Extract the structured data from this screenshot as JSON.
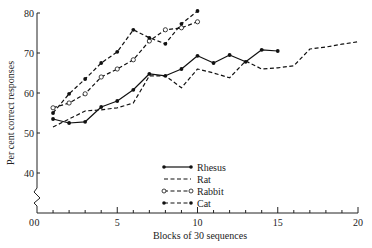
{
  "chart_data": {
    "type": "line",
    "title": "",
    "xlabel": "Blocks of 30 sequences",
    "ylabel": "Per cent correct responses",
    "xlim": [
      0,
      20
    ],
    "ylim": [
      0,
      80
    ],
    "y_axis_break": true,
    "x_ticks": [
      0,
      5,
      10,
      15,
      20
    ],
    "y_ticks": [
      0,
      40,
      50,
      60,
      70,
      80
    ],
    "grid": false,
    "legend_position": "center-bottom",
    "series": [
      {
        "name": "Rhesus",
        "style": "solid",
        "marker": "filled-circle",
        "x": [
          1,
          2,
          3,
          4,
          5,
          6,
          7,
          8,
          9,
          10,
          11,
          12,
          13,
          14,
          15
        ],
        "values": [
          53.5,
          52.5,
          52.8,
          56.5,
          58,
          60.8,
          64.8,
          64.3,
          66,
          69.3,
          67.5,
          69.5,
          67.8,
          70.8,
          70.5
        ]
      },
      {
        "name": "Rat",
        "style": "dashed",
        "marker": "none",
        "x": [
          1,
          3,
          4,
          5,
          6,
          7,
          8,
          9,
          10,
          11,
          12,
          13,
          14,
          15,
          16,
          17,
          18,
          19,
          20
        ],
        "values": [
          51.5,
          55.5,
          55.8,
          56.3,
          57.5,
          64.3,
          64.3,
          61.3,
          66,
          65,
          63.8,
          68,
          66,
          66.3,
          66.8,
          71,
          71.5,
          72.2,
          72.8
        ]
      },
      {
        "name": "Rabbit",
        "style": "dashed",
        "marker": "open-circle",
        "x": [
          1,
          2,
          3,
          4,
          5,
          6,
          7,
          8,
          9,
          10
        ],
        "values": [
          56.3,
          57.5,
          59.8,
          64,
          66,
          68.3,
          73,
          75.8,
          76.3,
          77.8
        ]
      },
      {
        "name": "Cat",
        "style": "dashed",
        "marker": "filled-circle",
        "x": [
          1,
          2,
          3,
          4,
          5,
          6,
          7,
          8,
          9,
          10
        ],
        "values": [
          55,
          59.8,
          63.5,
          67.5,
          70.3,
          75.8,
          73.8,
          72.3,
          77.3,
          80.5
        ]
      }
    ]
  },
  "axes": {
    "xlabel": "Blocks of 30 sequences",
    "ylabel": "Per cent correct responses",
    "x_tick_labels": [
      "0",
      "5",
      "10",
      "15",
      "20"
    ],
    "y_tick_labels": [
      "80",
      "70",
      "60",
      "50",
      "40",
      "0"
    ]
  },
  "legend": {
    "items": [
      {
        "label": "Rhesus"
      },
      {
        "label": "Rat"
      },
      {
        "label": "Rabbit"
      },
      {
        "label": "Cat"
      }
    ]
  }
}
